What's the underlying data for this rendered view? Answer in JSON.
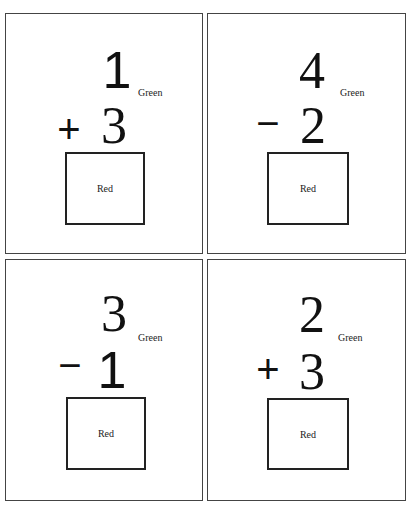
{
  "cards": [
    {
      "position": "top-left",
      "top_number": "1",
      "operator": "+",
      "bottom_number": "3",
      "number_color_label": "Green",
      "answer_box_label": "Red"
    },
    {
      "position": "top-right",
      "top_number": "4",
      "operator": "−",
      "bottom_number": "2",
      "number_color_label": "Green",
      "answer_box_label": "Red"
    },
    {
      "position": "bottom-left",
      "top_number": "3",
      "operator": "−",
      "bottom_number": "1",
      "number_color_label": "Green",
      "answer_box_label": "Red"
    },
    {
      "position": "bottom-right",
      "top_number": "2",
      "operator": "+",
      "bottom_number": "3",
      "number_color_label": "Green",
      "answer_box_label": "Red"
    }
  ]
}
